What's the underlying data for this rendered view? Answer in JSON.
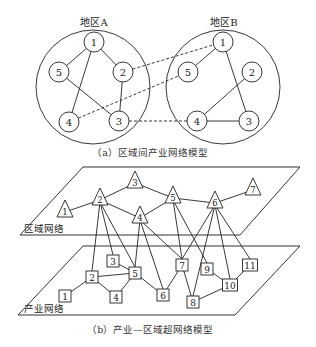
{
  "part_a": {
    "caption": "（a）区域间产业网络模型",
    "regions": [
      {
        "label": "地区A",
        "center": [
          93,
          87
        ],
        "radius": 57,
        "nodes": [
          {
            "id": "1",
            "x": 94,
            "y": 42
          },
          {
            "id": "2",
            "x": 123,
            "y": 72
          },
          {
            "id": "3",
            "x": 119,
            "y": 121
          },
          {
            "id": "4",
            "x": 69,
            "y": 122
          },
          {
            "id": "5",
            "x": 59,
            "y": 72
          }
        ],
        "edges": [
          [
            "1",
            "5"
          ],
          [
            "1",
            "2"
          ],
          [
            "1",
            "4"
          ],
          [
            "2",
            "3"
          ],
          [
            "5",
            "3"
          ]
        ]
      },
      {
        "label": "地区B",
        "center": [
          223,
          87
        ],
        "radius": 57,
        "nodes": [
          {
            "id": "1",
            "x": 223,
            "y": 42
          },
          {
            "id": "2",
            "x": 252,
            "y": 72
          },
          {
            "id": "3",
            "x": 249,
            "y": 121
          },
          {
            "id": "4",
            "x": 197,
            "y": 121
          },
          {
            "id": "5",
            "x": 188,
            "y": 72
          }
        ],
        "edges": [
          [
            "1",
            "5"
          ],
          [
            "1",
            "3"
          ],
          [
            "2",
            "4"
          ],
          [
            "4",
            "3"
          ]
        ]
      }
    ],
    "inter_edges": [
      {
        "from": "A2",
        "to": "B1"
      },
      {
        "from": "A4",
        "to": "B5"
      },
      {
        "from": "A3",
        "to": "B4"
      }
    ]
  },
  "part_b": {
    "caption": "（b）产业—区域超网络模型",
    "region_layer": {
      "label": "区域网络",
      "plane": [
        [
          83,
          167
        ],
        [
          300,
          167
        ],
        [
          240,
          235
        ],
        [
          20,
          235
        ]
      ],
      "nodes": [
        {
          "id": "1",
          "x": 65,
          "y": 212
        },
        {
          "id": "2",
          "x": 100,
          "y": 200
        },
        {
          "id": "3",
          "x": 135,
          "y": 183
        },
        {
          "id": "4",
          "x": 140,
          "y": 218
        },
        {
          "id": "5",
          "x": 173,
          "y": 198
        },
        {
          "id": "6",
          "x": 215,
          "y": 203
        },
        {
          "id": "7",
          "x": 253,
          "y": 190
        }
      ],
      "edges": [
        [
          "1",
          "2"
        ],
        [
          "2",
          "3"
        ],
        [
          "2",
          "4"
        ],
        [
          "3",
          "5"
        ],
        [
          "4",
          "5"
        ],
        [
          "5",
          "6"
        ],
        [
          "6",
          "7"
        ]
      ]
    },
    "industry_layer": {
      "label": "产业网络",
      "plane": [
        [
          83,
          246
        ],
        [
          300,
          246
        ],
        [
          235,
          315
        ],
        [
          18,
          315
        ]
      ],
      "nodes": [
        {
          "id": "1",
          "x": 65,
          "y": 296
        },
        {
          "id": "2",
          "x": 92,
          "y": 277
        },
        {
          "id": "3",
          "x": 113,
          "y": 261
        },
        {
          "id": "4",
          "x": 116,
          "y": 297
        },
        {
          "id": "5",
          "x": 135,
          "y": 273
        },
        {
          "id": "6",
          "x": 163,
          "y": 295
        },
        {
          "id": "7",
          "x": 182,
          "y": 265
        },
        {
          "id": "8",
          "x": 193,
          "y": 302
        },
        {
          "id": "9",
          "x": 207,
          "y": 269
        },
        {
          "id": "10",
          "x": 230,
          "y": 285
        },
        {
          "id": "11",
          "x": 250,
          "y": 265
        }
      ],
      "edges": [
        [
          "1",
          "2"
        ],
        [
          "2",
          "4"
        ],
        [
          "2",
          "5"
        ],
        [
          "3",
          "5"
        ],
        [
          "4",
          "5"
        ],
        [
          "5",
          "6"
        ],
        [
          "6",
          "7"
        ],
        [
          "7",
          "8"
        ],
        [
          "8",
          "10"
        ],
        [
          "9",
          "10"
        ],
        [
          "10",
          "11"
        ]
      ]
    },
    "cross_edges": [
      [
        "R2",
        "I2"
      ],
      [
        "R2",
        "I3"
      ],
      [
        "R2",
        "I5"
      ],
      [
        "R4",
        "I5"
      ],
      [
        "R4",
        "I6"
      ],
      [
        "R4",
        "I7"
      ],
      [
        "R5",
        "I7"
      ],
      [
        "R5",
        "I9"
      ],
      [
        "R6",
        "I7"
      ],
      [
        "R6",
        "I8"
      ],
      [
        "R6",
        "I10"
      ],
      [
        "R6",
        "I11"
      ]
    ]
  }
}
